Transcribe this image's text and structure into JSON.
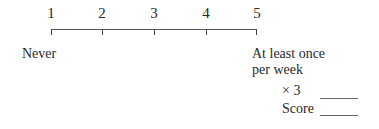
{
  "scale": {
    "points": [
      {
        "value": "1",
        "x": 51
      },
      {
        "value": "2",
        "x": 102
      },
      {
        "value": "3",
        "x": 154
      },
      {
        "value": "4",
        "x": 206
      },
      {
        "value": "5",
        "x": 257
      }
    ],
    "low_anchor": "Never",
    "high_anchor_line1": "At least once",
    "high_anchor_line2": "per week"
  },
  "scoring": {
    "multiplier_label": "× 3",
    "multiplier_blank": "",
    "score_label": "Score",
    "score_blank": ""
  }
}
